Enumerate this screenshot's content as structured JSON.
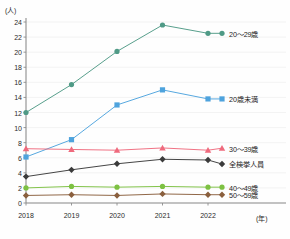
{
  "chart_data": {
    "type": "line",
    "title": "",
    "xlabel": "(年)",
    "ylabel": "(人)",
    "x": [
      "2018",
      "2019",
      "2020",
      "2021",
      "2022"
    ],
    "categories": [
      "2018",
      "2019",
      "2020",
      "2021",
      "2022"
    ],
    "ylim": [
      0,
      24
    ],
    "ytick_step": 2,
    "yticks": [
      "0",
      "2",
      "4",
      "6",
      "8",
      "10",
      "12",
      "14",
      "16",
      "18",
      "20",
      "22",
      "24"
    ],
    "grid": "horizontal",
    "legend_position": "right-inline",
    "series": [
      {
        "name": "20〜29歳",
        "values": [
          12.0,
          15.7,
          20.1,
          23.6,
          22.5
        ],
        "color": "#4f9a86",
        "marker": "circle"
      },
      {
        "name": "20歳未満",
        "values": [
          6.1,
          8.4,
          13.0,
          15.0,
          13.8
        ],
        "color": "#4ea3dd",
        "marker": "square"
      },
      {
        "name": "30〜39歳",
        "values": [
          7.2,
          7.1,
          7.0,
          7.3,
          7.0
        ],
        "color": "#ef6a7d",
        "marker": "triangle"
      },
      {
        "name": "全検挙人員",
        "values": [
          3.5,
          4.4,
          5.2,
          5.8,
          5.7
        ],
        "color": "#3b3b3b",
        "marker": "diamond"
      },
      {
        "name": "40〜49歳",
        "values": [
          2.0,
          2.2,
          2.1,
          2.2,
          2.1
        ],
        "color": "#7dc142",
        "marker": "circle"
      },
      {
        "name": "50〜59歳",
        "values": [
          1.0,
          1.1,
          1.0,
          1.2,
          1.1
        ],
        "color": "#8a5f3d",
        "marker": "diamond"
      }
    ]
  },
  "axis": {
    "y_unit": "(人)",
    "x_unit": "(年)"
  },
  "legend": {
    "items": [
      {
        "label": "20〜29歳"
      },
      {
        "label": "20歳未満"
      },
      {
        "label": "30〜39歳"
      },
      {
        "label": "全検挙人員"
      },
      {
        "label": "40〜49歳"
      },
      {
        "label": "50〜59歳"
      }
    ]
  },
  "footer": {
    "credit": ""
  }
}
